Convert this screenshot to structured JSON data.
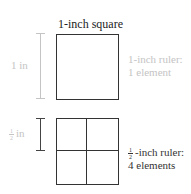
{
  "title": "1-inch square",
  "top": {
    "ruler_label": "1 in",
    "description_line1": "1-inch ruler:",
    "description_line2": "1 element"
  },
  "bottom": {
    "ruler_label_numerator": "1",
    "ruler_label_denominator": "2",
    "ruler_label_unit": "in",
    "description_frac_numerator": "1",
    "description_frac_denominator": "2",
    "description_line1_rest": "-inch ruler:",
    "description_line2": "4 elements"
  },
  "colors": {
    "stroke_dark": "#333333",
    "muted_gray": "#c4c4c4"
  }
}
